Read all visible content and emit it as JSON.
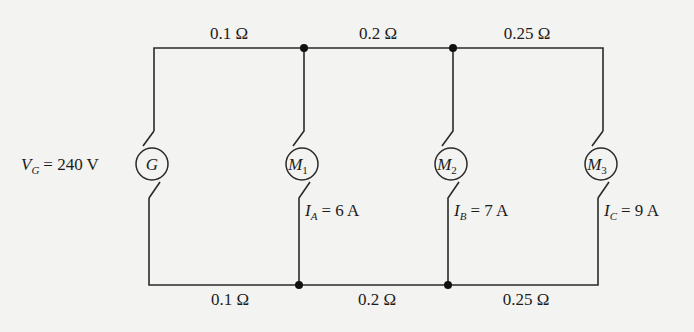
{
  "diagram": {
    "type": "circuit",
    "source": {
      "symbol": "G",
      "label_var": "V",
      "label_sub": "G",
      "label_value": "= 240 V"
    },
    "motors": [
      {
        "symbol": "M",
        "sub": "1",
        "current_var": "I",
        "current_sub": "A",
        "current_value": "= 6 A"
      },
      {
        "symbol": "M",
        "sub": "2",
        "current_var": "I",
        "current_sub": "B",
        "current_value": "= 7 A"
      },
      {
        "symbol": "M",
        "sub": "3",
        "current_var": "I",
        "current_sub": "C",
        "current_value": "= 9 A"
      }
    ],
    "top_resistances": [
      "0.1 Ω",
      "0.2 Ω",
      "0.25 Ω"
    ],
    "bottom_resistances": [
      "0.1 Ω",
      "0.2 Ω",
      "0.25 Ω"
    ],
    "colors": {
      "wire": "#2a2a2a",
      "background": "#f3f3f1",
      "text": "#1c1c1c"
    }
  }
}
